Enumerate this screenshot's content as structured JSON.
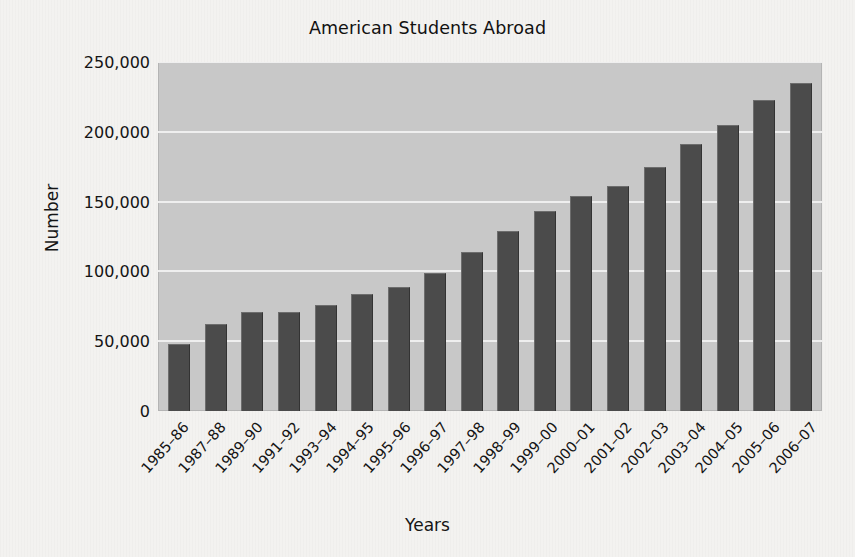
{
  "chart_data": {
    "type": "bar",
    "title": "American Students Abroad",
    "xlabel": "Years",
    "ylabel": "Number",
    "categories": [
      "1985–86",
      "1987–88",
      "1989–90",
      "1991–92",
      "1993–94",
      "1994–95",
      "1995–96",
      "1996–97",
      "1997–98",
      "1998–99",
      "1999–00",
      "2000–01",
      "2001–02",
      "2002–03",
      "2003–04",
      "2004–05",
      "2005–06",
      "2006–07"
    ],
    "values": [
      48000,
      62000,
      70700,
      71200,
      76000,
      84000,
      89000,
      99000,
      114000,
      129000,
      143000,
      154000,
      161000,
      175000,
      191000,
      205000,
      223000,
      235000
    ],
    "ylim": [
      0,
      250000
    ],
    "ytick_values": [
      0,
      50000,
      100000,
      150000,
      200000,
      250000
    ],
    "ytick_labels": [
      "0",
      "50,000",
      "100,000",
      "150,000",
      "200,000",
      "250,000"
    ],
    "grid": true,
    "legend": false,
    "colors": {
      "bar": "#4b4b4b",
      "plot_background": "#c8c8c8",
      "page_background": "#f3f2f0",
      "gridline": "#efefef",
      "text": "#151515"
    }
  }
}
